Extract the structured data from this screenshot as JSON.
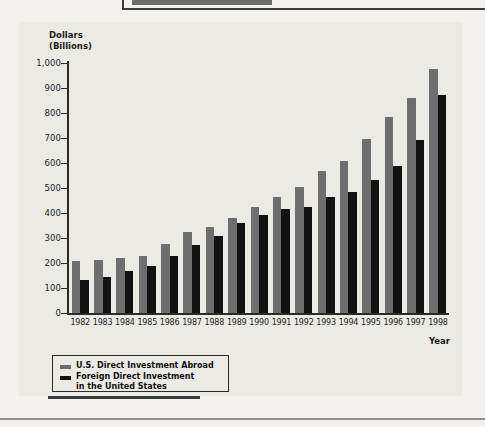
{
  "figure": {
    "y_axis_title": "Dollars\n(Billions)",
    "x_axis_title": "Year",
    "legend": {
      "series_1_label": "U.S. Direct Investment Abroad",
      "series_2_label": "Foreign Direct Investment\nin the United States",
      "series_1_color": "#6e6e6e",
      "series_2_color": "#121212"
    }
  },
  "chart_data": {
    "type": "bar",
    "title": "",
    "xlabel": "Year",
    "ylabel": "Dollars (Billions)",
    "ylim": [
      0,
      1000
    ],
    "ytick_labels": [
      "1,000",
      "900",
      "800",
      "700",
      "600",
      "500",
      "400",
      "300",
      "200",
      "100",
      "0"
    ],
    "ytick_values": [
      1000,
      900,
      800,
      700,
      600,
      500,
      400,
      300,
      200,
      100,
      0
    ],
    "grid": false,
    "legend_position": "below-left",
    "categories": [
      "1982",
      "1983",
      "1984",
      "1985",
      "1986",
      "1987",
      "1988",
      "1989",
      "1990",
      "1991",
      "1992",
      "1993",
      "1994",
      "1995",
      "1996",
      "1997",
      "1998"
    ],
    "series": [
      {
        "name": "U.S. Direct Investment Abroad",
        "color": "#6e6e6e",
        "values": [
          208,
          212,
          220,
          230,
          275,
          325,
          345,
          382,
          425,
          465,
          503,
          570,
          610,
          698,
          785,
          862,
          978
        ]
      },
      {
        "name": "Foreign Direct Investment in the United States",
        "color": "#121212",
        "values": [
          131,
          145,
          170,
          190,
          227,
          271,
          310,
          362,
          392,
          416,
          424,
          465,
          483,
          532,
          590,
          692,
          872
        ]
      }
    ]
  }
}
